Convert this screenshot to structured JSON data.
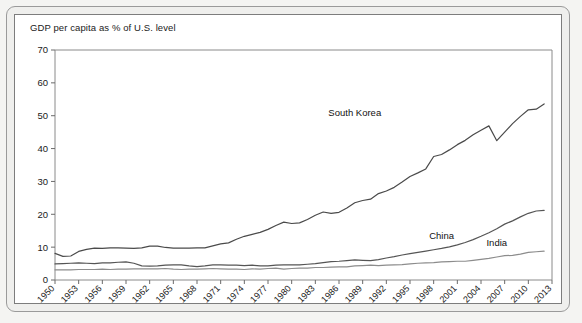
{
  "figure": {
    "title": "GDP per capita as % of U.S. level",
    "border_color": "#7d7d7d",
    "background": "#ffffff"
  },
  "chart_data": {
    "type": "line",
    "title": "GDP per capita as % of U.S. level",
    "xlabel": "",
    "ylabel": "",
    "xlim": [
      1950,
      2013
    ],
    "ylim": [
      0,
      70
    ],
    "ytick_values": [
      0,
      10,
      20,
      30,
      40,
      50,
      60,
      70
    ],
    "ytick_labels": [
      "0",
      "10",
      "20",
      "30",
      "40",
      "50",
      "60",
      "70"
    ],
    "xtick_values": [
      1950,
      1953,
      1956,
      1959,
      1962,
      1965,
      1968,
      1971,
      1974,
      1977,
      1980,
      1983,
      1986,
      1989,
      1992,
      1995,
      1998,
      2001,
      2004,
      2007,
      2010,
      2013
    ],
    "xtick_labels": [
      "1950",
      "1953",
      "1956",
      "1959",
      "1962",
      "1965",
      "1968",
      "1971",
      "1974",
      "1977",
      "1980",
      "1983",
      "1986",
      "1989",
      "1992",
      "1995",
      "1998",
      "2001",
      "2004",
      "2007",
      "2010",
      "2013"
    ],
    "xtick_rotation": 45,
    "grid": false,
    "legend_position": "inline-annotations",
    "x": [
      1950,
      1951,
      1952,
      1953,
      1954,
      1955,
      1956,
      1957,
      1958,
      1959,
      1960,
      1961,
      1962,
      1963,
      1964,
      1965,
      1966,
      1967,
      1968,
      1969,
      1970,
      1971,
      1972,
      1973,
      1974,
      1975,
      1976,
      1977,
      1978,
      1979,
      1980,
      1981,
      1982,
      1983,
      1984,
      1985,
      1986,
      1987,
      1988,
      1989,
      1990,
      1991,
      1992,
      1993,
      1994,
      1995,
      1996,
      1997,
      1998,
      1999,
      2000,
      2001,
      2002,
      2003,
      2004,
      2005,
      2006,
      2007,
      2008,
      2009,
      2010,
      2011,
      2012
    ],
    "series": [
      {
        "name": "South Korea",
        "color": "#4a4a4a",
        "label_x": 1988,
        "label_y": 50,
        "values": [
          8.1,
          7.2,
          7.3,
          8.7,
          9.3,
          9.7,
          9.6,
          9.8,
          9.8,
          9.7,
          9.6,
          9.8,
          10.3,
          10.3,
          9.9,
          9.7,
          9.7,
          9.7,
          9.8,
          9.8,
          10.4,
          11.0,
          11.3,
          12.4,
          13.3,
          13.9,
          14.5,
          15.4,
          16.6,
          17.6,
          17.2,
          17.4,
          18.4,
          19.7,
          20.7,
          20.3,
          20.6,
          21.9,
          23.5,
          24.2,
          24.6,
          26.3,
          27.1,
          28.2,
          29.8,
          31.5,
          32.6,
          33.8,
          37.6,
          38.2,
          39.6,
          41.2,
          42.5,
          44.2,
          45.6,
          46.9,
          42.4,
          45.0,
          47.6,
          49.8,
          51.8,
          52.0,
          53.6
        ]
      },
      {
        "name": "China",
        "color": "#555555",
        "label_x": 1999,
        "label_y": 12.5,
        "values": [
          4.9,
          5.0,
          5.1,
          5.2,
          5.1,
          5.0,
          5.2,
          5.2,
          5.4,
          5.5,
          5.1,
          4.3,
          4.2,
          4.3,
          4.5,
          4.6,
          4.6,
          4.3,
          4.1,
          4.3,
          4.6,
          4.6,
          4.5,
          4.5,
          4.4,
          4.5,
          4.3,
          4.3,
          4.5,
          4.6,
          4.6,
          4.6,
          4.8,
          5.0,
          5.3,
          5.6,
          5.7,
          5.9,
          6.1,
          6.0,
          5.9,
          6.2,
          6.7,
          7.1,
          7.6,
          8.0,
          8.4,
          8.8,
          9.2,
          9.6,
          10.1,
          10.7,
          11.4,
          12.3,
          13.3,
          14.4,
          15.6,
          17.0,
          18.0,
          19.2,
          20.3,
          21.0,
          21.2
        ]
      },
      {
        "name": "India",
        "color": "#8c8c8c",
        "label_x": 2006,
        "label_y": 10.5,
        "values": [
          3.1,
          3.1,
          3.1,
          3.2,
          3.2,
          3.2,
          3.3,
          3.2,
          3.3,
          3.3,
          3.4,
          3.4,
          3.4,
          3.4,
          3.5,
          3.3,
          3.2,
          3.3,
          3.3,
          3.4,
          3.5,
          3.4,
          3.3,
          3.3,
          3.2,
          3.4,
          3.3,
          3.5,
          3.6,
          3.3,
          3.5,
          3.6,
          3.6,
          3.8,
          3.8,
          3.9,
          4.0,
          4.0,
          4.3,
          4.4,
          4.5,
          4.4,
          4.5,
          4.6,
          4.7,
          4.9,
          5.1,
          5.2,
          5.3,
          5.5,
          5.6,
          5.7,
          5.7,
          6.0,
          6.3,
          6.6,
          7.0,
          7.4,
          7.5,
          7.9,
          8.4,
          8.6,
          8.8
        ]
      }
    ]
  }
}
